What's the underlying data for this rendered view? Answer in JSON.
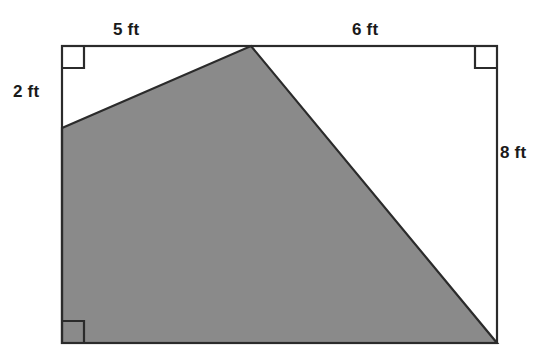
{
  "figure": {
    "colors": {
      "outline": "#2b2b2b",
      "shaded_fill": "#8a8a8a",
      "background": "#ffffff",
      "label_text": "#1a1a1a"
    },
    "rectangle": {
      "top_left": [
        62,
        46
      ],
      "top_right": [
        497,
        46
      ],
      "bottom_right": [
        497,
        343
      ],
      "bottom_left": [
        62,
        343
      ]
    },
    "shaded_region": {
      "vertices": [
        [
          62,
          128
        ],
        [
          251,
          46
        ],
        [
          497,
          343
        ],
        [
          62,
          343
        ]
      ]
    },
    "right_angle_markers": [
      {
        "name": "top-left-right-angle",
        "x": 62,
        "y": 46,
        "size": 22,
        "corner": "tl"
      },
      {
        "name": "top-right-right-angle",
        "x": 497,
        "y": 46,
        "size": 22,
        "corner": "tr"
      },
      {
        "name": "bottom-left-right-angle",
        "x": 62,
        "y": 343,
        "size": 22,
        "corner": "bl"
      }
    ],
    "labels": {
      "top_left_segment": "5 ft",
      "top_right_segment": "6 ft",
      "left_segment": "2 ft",
      "right_side": "8 ft"
    }
  }
}
